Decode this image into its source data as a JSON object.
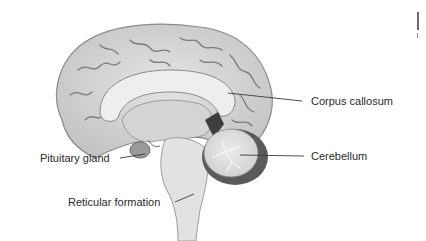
{
  "diagram": {
    "labels": [
      {
        "id": "corpus-callosum",
        "text": "Corpus callosum"
      },
      {
        "id": "cerebellum",
        "text": "Cerebellum"
      },
      {
        "id": "pituitary-gland",
        "text": "Pituitary gland"
      },
      {
        "id": "reticular-formation",
        "text": "Reticular formation"
      }
    ],
    "colors": {
      "background": "#ffffff",
      "brain_tissue": "#d9d9d9",
      "sulci": "#7a7a7a",
      "corpus_callosum": "#ececec",
      "dark_region": "#4a4a4a",
      "leader_line": "#3a3a3a"
    }
  }
}
